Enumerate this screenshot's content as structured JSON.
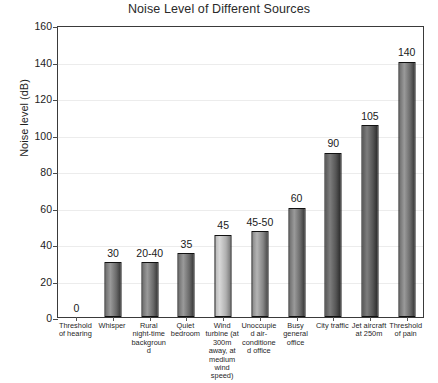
{
  "chart_data": {
    "type": "bar",
    "title": "Noise Level of Different Sources",
    "xlabel": "",
    "ylabel": "Noise level (dB)",
    "ylim": [
      0,
      160
    ],
    "ytick_step": 20,
    "yticks": [
      0,
      20,
      40,
      60,
      80,
      100,
      120,
      140,
      160
    ],
    "grid": true,
    "legend": "none",
    "categories": [
      "Threshold of hearing",
      "Whisper",
      "Rural night-time background",
      "Quiet bedroom",
      "Wind turbine (at 300m away, at medium wind speed)",
      "Unoccupied air-conditioned office",
      "Busy general office",
      "City traffic",
      "Jet aircraft at 250m",
      "Threshold of pain"
    ],
    "values": [
      0,
      30,
      30,
      35,
      45,
      47,
      60,
      90,
      105,
      140
    ],
    "value_labels": [
      "0",
      "30",
      "20-40",
      "35",
      "45",
      "45-50",
      "60",
      "90",
      "105",
      "140"
    ]
  },
  "bar_styles": [
    "g-dark",
    "g-dark",
    "g-dark",
    "g-dark",
    "g-light",
    "g-mid",
    "g-dark",
    "g-deep",
    "g-deep",
    "g-dark"
  ]
}
